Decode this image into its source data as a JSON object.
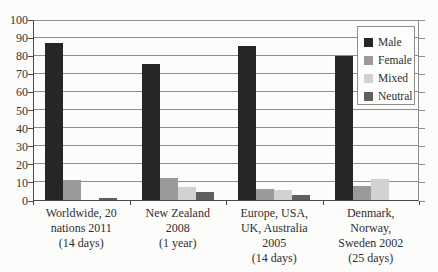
{
  "figure": {
    "background_color": "#fcfcfb",
    "text_color": "#2f2f2f",
    "axis_color": "#4a4a4a",
    "gridline_color": "#8e8e8e"
  },
  "chart_data": {
    "type": "bar",
    "title": "",
    "xlabel": "",
    "ylabel": "",
    "ylim": [
      0,
      100
    ],
    "yticks": [
      0,
      10,
      20,
      30,
      40,
      50,
      60,
      70,
      80,
      90,
      100
    ],
    "grid": true,
    "legend_position": "top-right",
    "categories": [
      "Worldwide, 20 nations 2011 (14 days)",
      "New Zealand 2008 (1 year)",
      "Europe, USA, UK, Australia 2005 (14 days)",
      "Denmark, Norway, Sweden 2002 (25 days)"
    ],
    "category_label_lines": [
      [
        "Worldwide, 20",
        "nations 2011",
        "(14 days)"
      ],
      [
        "New Zealand",
        "2008",
        "(1 year)"
      ],
      [
        "Europe, USA,",
        "UK, Australia",
        "2005",
        "(14 days)"
      ],
      [
        "Denmark,",
        "Norway,",
        "Sweden 2002",
        "(25 days)"
      ]
    ],
    "series": [
      {
        "name": "Male",
        "color": "#262626",
        "values": [
          87,
          75,
          85,
          79.5
        ]
      },
      {
        "name": "Female",
        "color": "#9a9a9a",
        "values": [
          11,
          12,
          6,
          7.5
        ]
      },
      {
        "name": "Mixed",
        "color": "#d2d2d2",
        "values": [
          0,
          7,
          5.5,
          11.5
        ]
      },
      {
        "name": "Neutral",
        "color": "#5f5f5f",
        "values": [
          1,
          4.5,
          3,
          0
        ]
      }
    ],
    "legend_entries": [
      "Male",
      "Female",
      "Mixed",
      "Neutral"
    ]
  }
}
